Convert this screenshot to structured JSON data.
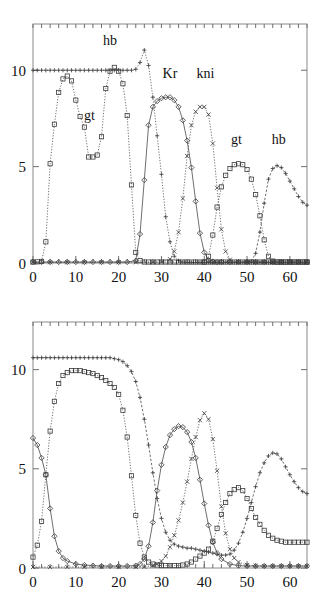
{
  "figure": {
    "panels": [
      "top",
      "bottom"
    ]
  },
  "chart_data": [
    {
      "id": "top",
      "type": "line",
      "title": "",
      "xlabel": "",
      "ylabel": "",
      "xlim": [
        0,
        64
      ],
      "ylim": [
        0,
        12.4
      ],
      "xticks": [
        0,
        10,
        20,
        30,
        40,
        50,
        60
      ],
      "yticks": [
        0,
        5,
        10
      ],
      "xticklabels": [
        "0",
        "10",
        "20",
        "30",
        "40",
        "50",
        "60"
      ],
      "yticklabels": [
        "0",
        "5",
        "10"
      ],
      "grid": false,
      "legend": "inline-annotations",
      "annotations": [
        {
          "text": "hb",
          "x": 18.0,
          "y": 11.3
        },
        {
          "text": "gt",
          "x": 13.2,
          "y": 7.4
        },
        {
          "text": "Kr",
          "x": 32.0,
          "y": 9.6
        },
        {
          "text": "kni",
          "x": 40.3,
          "y": 9.6
        },
        {
          "text": "gt",
          "x": 47.5,
          "y": 6.2
        },
        {
          "text": "hb",
          "x": 57.4,
          "y": 6.2
        }
      ],
      "series": [
        {
          "name": "hb",
          "marker": "plus",
          "line": "dotted",
          "x": [
            0,
            1,
            2,
            3,
            4,
            5,
            6,
            7,
            8,
            9,
            10,
            11,
            12,
            13,
            14,
            15,
            16,
            17,
            18,
            19,
            20,
            21,
            22,
            23,
            24,
            25,
            26,
            27,
            28,
            29,
            30,
            31,
            32,
            33,
            34,
            35,
            36,
            37,
            38,
            39,
            40,
            41,
            42,
            43,
            44,
            45,
            46,
            47,
            48,
            49,
            50,
            51,
            52,
            53,
            54,
            55,
            56,
            57,
            58,
            59,
            60,
            61,
            62,
            63,
            64
          ],
          "y": [
            10.0,
            10.0,
            10.0,
            10.0,
            10.0,
            10.0,
            10.0,
            10.0,
            10.0,
            10.0,
            10.0,
            10.0,
            10.0,
            10.0,
            10.0,
            10.0,
            10.0,
            10.0,
            10.0,
            10.0,
            10.0,
            10.0,
            10.0,
            10.0,
            10.05,
            10.4,
            11.05,
            10.25,
            8.6,
            6.6,
            4.6,
            2.4,
            1.1,
            0.35,
            0.12,
            0.05,
            0.03,
            0.03,
            0.03,
            0.03,
            0.03,
            0.03,
            0.03,
            0.03,
            0.03,
            0.03,
            0.03,
            0.03,
            0.03,
            0.03,
            0.03,
            0.03,
            0.03,
            0.03,
            0.03,
            0.03,
            0.03,
            0.03,
            0.03,
            0.03,
            0.03,
            0.03,
            0.03,
            0.03,
            0.03
          ]
        },
        {
          "name": "gt-left",
          "marker": "square",
          "line": "dotted",
          "x": [
            0,
            1,
            2,
            3,
            4,
            5,
            6,
            7,
            8,
            9,
            10,
            11,
            12,
            13,
            14,
            15,
            16,
            17,
            18,
            19,
            20,
            21,
            22,
            23,
            24,
            25,
            26,
            27,
            28,
            29,
            30,
            31,
            32,
            33,
            34,
            35,
            36,
            37,
            38,
            39,
            40,
            41,
            42,
            43,
            44,
            45,
            46,
            47,
            48,
            49,
            50,
            51,
            52,
            53,
            54,
            55,
            56,
            57,
            58,
            59,
            60,
            61,
            62,
            63,
            64
          ],
          "y": [
            0.05,
            0.06,
            0.08,
            1.1,
            5.15,
            7.2,
            8.85,
            9.55,
            9.7,
            9.45,
            8.45,
            7.6,
            7.05,
            5.5,
            5.5,
            5.6,
            6.55,
            9.05,
            9.95,
            10.15,
            9.95,
            9.3,
            7.65,
            4.05,
            0.55,
            0.12,
            0.05,
            0.05,
            0.05,
            0.05,
            0.05,
            0.05,
            0.05,
            0.05,
            0.05,
            0.05,
            0.05,
            0.05,
            0.05,
            0.05,
            0.05,
            0.05,
            0.05,
            0.05,
            0.05,
            0.05,
            0.05,
            0.05,
            0.05,
            0.05,
            0.05,
            0.05,
            0.05,
            0.05,
            0.05,
            0.05,
            0.05,
            0.05,
            0.05,
            0.05,
            0.05,
            0.05,
            0.05,
            0.05,
            0.05
          ]
        },
        {
          "name": "Kr",
          "marker": "diamond",
          "line": "solid",
          "x": [
            0,
            2,
            4,
            6,
            8,
            10,
            12,
            14,
            16,
            18,
            20,
            22,
            24,
            25,
            26,
            27,
            28,
            29,
            30,
            31,
            32,
            33,
            34,
            35,
            36,
            37,
            38,
            39,
            40,
            41,
            42,
            43,
            44,
            46,
            48,
            50,
            52,
            54,
            56,
            58,
            60,
            62,
            64
          ],
          "y": [
            0.05,
            0.05,
            0.05,
            0.05,
            0.05,
            0.05,
            0.05,
            0.05,
            0.05,
            0.05,
            0.05,
            0.05,
            0.12,
            1.5,
            4.3,
            7.15,
            8.1,
            8.4,
            8.55,
            8.6,
            8.6,
            8.45,
            8.1,
            7.4,
            6.35,
            4.95,
            3.2,
            1.55,
            0.55,
            0.15,
            0.08,
            0.05,
            0.05,
            0.05,
            0.05,
            0.05,
            0.05,
            0.05,
            0.05,
            0.05,
            0.05,
            0.05,
            0.05
          ]
        },
        {
          "name": "kni",
          "marker": "cross",
          "line": "dotted",
          "x": [
            0,
            4,
            8,
            12,
            16,
            20,
            24,
            28,
            30,
            32,
            33,
            34,
            35,
            36,
            37,
            38,
            39,
            40,
            41,
            42,
            43,
            44,
            45,
            46,
            48,
            50,
            52,
            54,
            56,
            58,
            60,
            62,
            64
          ],
          "y": [
            0.04,
            0.04,
            0.04,
            0.04,
            0.04,
            0.04,
            0.04,
            0.04,
            0.06,
            0.2,
            0.6,
            1.6,
            3.35,
            5.55,
            7.15,
            7.85,
            8.1,
            8.1,
            7.7,
            6.2,
            3.9,
            1.75,
            0.6,
            0.18,
            0.05,
            0.04,
            0.04,
            0.04,
            0.04,
            0.04,
            0.04,
            0.04,
            0.04
          ]
        },
        {
          "name": "gt-right",
          "marker": "square",
          "line": "dotted",
          "x": [
            40,
            41,
            42,
            43,
            44,
            45,
            46,
            47,
            48,
            49,
            50,
            51,
            52,
            53,
            54,
            55,
            56,
            57,
            58,
            59,
            60,
            61,
            62,
            63,
            64
          ],
          "y": [
            0.05,
            0.35,
            1.45,
            2.9,
            3.95,
            4.55,
            4.9,
            5.1,
            5.15,
            5.1,
            4.85,
            4.35,
            3.55,
            2.45,
            1.2,
            0.35,
            0.1,
            0.05,
            0.05,
            0.05,
            0.05,
            0.05,
            0.05,
            0.05,
            0.05
          ]
        },
        {
          "name": "hb-right",
          "marker": "plus",
          "line": "dashed",
          "x": [
            50,
            51,
            52,
            53,
            54,
            55,
            56,
            57,
            58,
            59,
            60,
            61,
            62,
            63,
            64
          ],
          "y": [
            0.05,
            0.1,
            0.5,
            1.6,
            3.1,
            4.35,
            4.9,
            5.05,
            4.95,
            4.65,
            4.25,
            3.85,
            3.45,
            3.15,
            3.0
          ]
        }
      ]
    },
    {
      "id": "bottom",
      "type": "line",
      "title": "",
      "xlabel": "",
      "ylabel": "",
      "xlim": [
        0,
        64
      ],
      "ylim": [
        0,
        12.4
      ],
      "xticks": [
        0,
        10,
        20,
        30,
        40,
        50,
        60
      ],
      "yticks": [
        0,
        5,
        10
      ],
      "xticklabels": [
        "0",
        "10",
        "20",
        "30",
        "40",
        "50",
        "60"
      ],
      "yticklabels": [
        "0",
        "5",
        "10"
      ],
      "grid": false,
      "legend": "none",
      "annotations": [],
      "series": [
        {
          "name": "hb",
          "marker": "plus",
          "line": "dashed",
          "x": [
            0,
            1,
            2,
            3,
            4,
            5,
            6,
            7,
            8,
            9,
            10,
            11,
            12,
            13,
            14,
            15,
            16,
            17,
            18,
            19,
            20,
            21,
            22,
            23,
            24,
            25,
            26,
            27,
            28,
            29,
            30,
            31,
            32,
            33,
            34,
            35,
            36,
            37,
            38,
            39,
            40,
            41,
            42,
            43,
            44,
            45,
            46,
            47,
            48,
            49,
            50,
            51,
            52,
            53,
            54,
            55,
            56,
            57,
            58,
            59,
            60,
            61,
            62,
            63,
            64
          ],
          "y": [
            10.6,
            10.6,
            10.6,
            10.6,
            10.6,
            10.6,
            10.6,
            10.6,
            10.6,
            10.6,
            10.6,
            10.6,
            10.6,
            10.6,
            10.6,
            10.6,
            10.6,
            10.6,
            10.6,
            10.55,
            10.5,
            10.4,
            10.2,
            9.9,
            9.4,
            8.6,
            7.5,
            6.2,
            4.8,
            3.5,
            2.5,
            1.8,
            1.4,
            1.2,
            1.1,
            1.05,
            1.0,
            1.0,
            0.95,
            0.9,
            0.85,
            0.8,
            0.75,
            0.7,
            0.65,
            0.65,
            0.7,
            0.9,
            1.25,
            1.8,
            2.5,
            3.3,
            4.1,
            4.8,
            5.3,
            5.65,
            5.8,
            5.75,
            5.5,
            5.1,
            4.7,
            4.35,
            4.05,
            3.85,
            3.75
          ]
        },
        {
          "name": "gt",
          "marker": "square",
          "line": "dotted",
          "x": [
            0,
            1,
            2,
            3,
            4,
            5,
            6,
            7,
            8,
            9,
            10,
            11,
            12,
            13,
            14,
            15,
            16,
            17,
            18,
            19,
            20,
            21,
            22,
            23,
            24,
            25,
            26,
            27,
            28,
            29,
            30,
            31,
            32,
            33,
            34,
            35,
            36,
            37,
            38,
            39,
            40,
            41,
            42,
            43,
            44,
            45,
            46,
            47,
            48,
            49,
            50,
            51,
            52,
            53,
            54,
            55,
            56,
            57,
            58,
            59,
            60,
            61,
            62,
            63,
            64
          ],
          "y": [
            0.55,
            1.15,
            2.35,
            4.7,
            6.9,
            8.4,
            9.3,
            9.7,
            9.85,
            9.95,
            9.95,
            9.95,
            9.9,
            9.85,
            9.8,
            9.7,
            9.6,
            9.45,
            9.3,
            9.1,
            8.75,
            7.95,
            6.6,
            4.65,
            2.65,
            1.25,
            0.55,
            0.3,
            0.2,
            0.15,
            0.12,
            0.12,
            0.12,
            0.12,
            0.12,
            0.15,
            0.2,
            0.3,
            0.45,
            0.6,
            0.75,
            0.95,
            1.35,
            2.0,
            2.7,
            3.3,
            3.75,
            3.95,
            4.05,
            3.9,
            3.5,
            3.0,
            2.55,
            2.2,
            1.9,
            1.65,
            1.5,
            1.4,
            1.35,
            1.3,
            1.3,
            1.3,
            1.3,
            1.3,
            1.3
          ]
        },
        {
          "name": "Kr",
          "marker": "diamond",
          "line": "solid",
          "x": [
            0,
            1,
            2,
            3,
            4,
            5,
            6,
            7,
            8,
            10,
            12,
            14,
            16,
            18,
            20,
            22,
            24,
            25,
            26,
            27,
            28,
            29,
            30,
            31,
            32,
            33,
            34,
            35,
            36,
            37,
            38,
            39,
            40,
            41,
            42,
            43,
            44,
            46,
            48,
            50,
            52,
            54,
            56,
            58,
            60,
            62,
            64
          ],
          "y": [
            6.55,
            6.2,
            5.55,
            4.7,
            3.0,
            1.6,
            0.85,
            0.5,
            0.35,
            0.2,
            0.15,
            0.12,
            0.1,
            0.1,
            0.1,
            0.1,
            0.12,
            0.2,
            0.45,
            1.1,
            2.3,
            3.9,
            5.2,
            6.1,
            6.7,
            7.0,
            7.15,
            7.1,
            6.85,
            6.35,
            5.55,
            4.45,
            3.25,
            2.15,
            1.3,
            0.75,
            0.45,
            0.2,
            0.12,
            0.1,
            0.1,
            0.1,
            0.1,
            0.1,
            0.1,
            0.1,
            0.1
          ]
        },
        {
          "name": "kni",
          "marker": "cross",
          "line": "dotted",
          "x": [
            0,
            4,
            8,
            12,
            16,
            20,
            24,
            26,
            28,
            29,
            30,
            31,
            32,
            33,
            34,
            35,
            36,
            37,
            38,
            39,
            40,
            41,
            42,
            43,
            44,
            45,
            46,
            47,
            48,
            50,
            52,
            54,
            56,
            58,
            60,
            62,
            64
          ],
          "y": [
            0.05,
            0.05,
            0.05,
            0.05,
            0.05,
            0.05,
            0.05,
            0.06,
            0.12,
            0.2,
            0.35,
            0.6,
            1.05,
            1.65,
            2.4,
            3.3,
            4.35,
            5.5,
            6.6,
            7.45,
            7.8,
            7.5,
            6.5,
            4.9,
            3.1,
            1.75,
            0.95,
            0.5,
            0.3,
            0.15,
            0.12,
            0.1,
            0.1,
            0.1,
            0.1,
            0.1,
            0.1
          ]
        }
      ]
    }
  ]
}
